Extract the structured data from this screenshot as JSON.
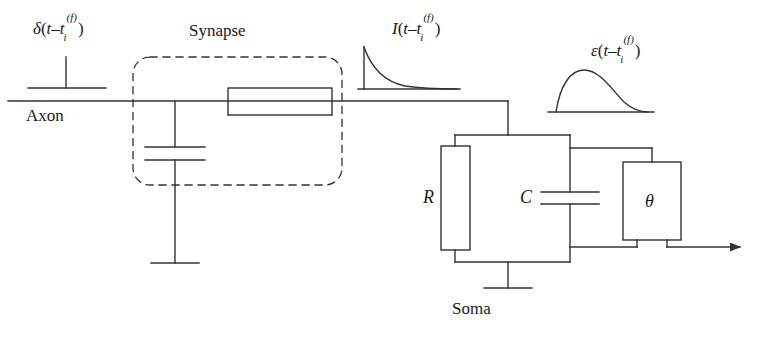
{
  "figure": {
    "type": "circuit-diagram",
    "background_color": "#ffffff",
    "line_color": "#333333",
    "text_color": "#1a1a1a"
  },
  "labels": {
    "spike_input": {
      "greek": "δ",
      "open": "(",
      "var": "t",
      "minus": "–",
      "var2": "t",
      "sub": "i",
      "sup": "(f)",
      "close": ")",
      "plain": "δ(t–t_i^(f))"
    },
    "axon": "Axon",
    "synapse": "Synapse",
    "current": {
      "greek": "I",
      "open": "(",
      "var": "t",
      "minus": "–",
      "var2": "t",
      "sub": "i",
      "sup": "(f)",
      "close": ")",
      "plain": "I(t–t_i^(f))"
    },
    "epsp": {
      "greek": "ε",
      "open": "(",
      "var": "t",
      "minus": "–",
      "var2": "t",
      "sub": "i",
      "sup": "(f)",
      "close": ")",
      "plain": "ε(t–t_i^(f))"
    },
    "resistance": "R",
    "capacitance": "C",
    "threshold": "θ",
    "soma": "Soma"
  },
  "components": {
    "synapse_box": {
      "label": "Synapse",
      "style": "dashed-rounded"
    },
    "synapse_resistor": {
      "label": "",
      "orientation": "horizontal"
    },
    "synapse_capacitor": {
      "label": "",
      "orientation": "horizontal-plates"
    },
    "soma_resistor": {
      "label": "R",
      "orientation": "vertical"
    },
    "soma_capacitor": {
      "label": "C",
      "orientation": "horizontal-plates"
    },
    "threshold_unit": {
      "label": "θ",
      "shape": "rectangle"
    },
    "output": {
      "label": "",
      "shape": "arrow-right"
    }
  },
  "waveforms": {
    "spike": {
      "name": "delta-impulse",
      "shape": "vertical-bar-on-baseline"
    },
    "current": {
      "name": "exponential-decay",
      "shape": "fast-rise-exp-decay"
    },
    "epsp": {
      "name": "alpha-function",
      "shape": "rise-peak-decay"
    }
  }
}
